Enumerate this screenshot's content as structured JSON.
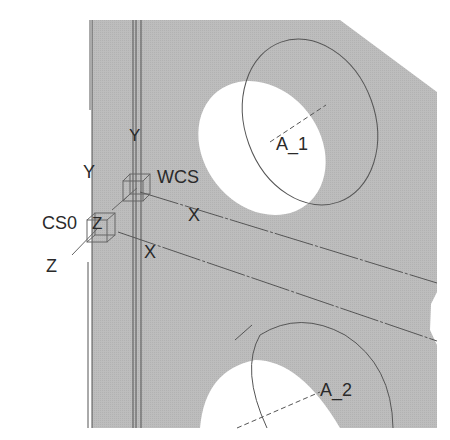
{
  "viewport": {
    "background": "#ffffff",
    "part_fill": "#b9b9b9",
    "line_color": "#4a4a4a"
  },
  "coordinate_systems": {
    "wcs": {
      "name": "WCS",
      "x_label": "X",
      "y_label": "Y"
    },
    "cs0": {
      "name": "CS0",
      "x_label": "X",
      "y_label": "Y",
      "z_label": "Z",
      "z_inline_label": "Z"
    }
  },
  "axes": [
    {
      "name": "A_1"
    },
    {
      "name": "A_2"
    }
  ]
}
